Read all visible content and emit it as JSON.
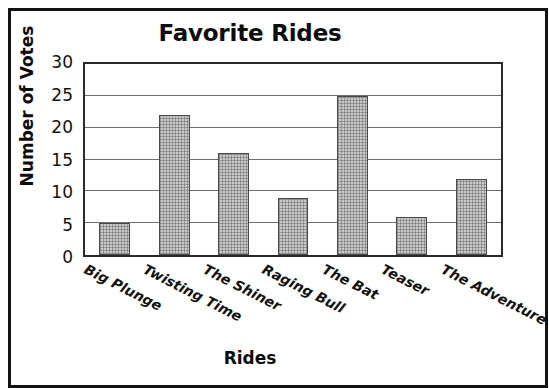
{
  "chart_data": {
    "type": "bar",
    "title": "Favorite Rides",
    "xlabel": "Rides",
    "ylabel": "Number of Votes",
    "categories": [
      "Big Plunge",
      "Twisting Time",
      "The Shiner",
      "Raging Bull",
      "The Bat",
      "Teaser",
      "The Adventure"
    ],
    "values": [
      5,
      22,
      16,
      9,
      25,
      6,
      12
    ],
    "ylim": [
      0,
      30
    ],
    "yticks": [
      0,
      5,
      10,
      15,
      20,
      25,
      30
    ],
    "ytick_labels": [
      "0",
      "5",
      "10",
      "15",
      "20",
      "25",
      "30"
    ],
    "grid": "horizontal",
    "legend": "none",
    "bar_fill_color": "#c9c9c9",
    "bar_edge_color": "#4a4a4a",
    "gridline_color": "#6e6e6e",
    "axis_color": "#2a2a2a",
    "frame_color": "#131313",
    "background_color": "#ffffff",
    "xtick_rotation_degrees": 27
  }
}
